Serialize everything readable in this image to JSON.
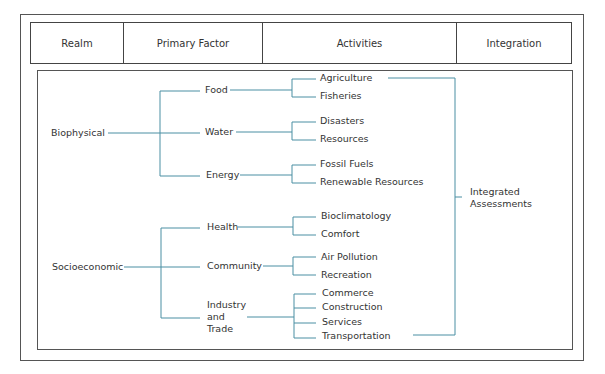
{
  "header": {
    "columns": [
      "Realm",
      "Primary Factor",
      "Activities",
      "Integration"
    ]
  },
  "tree": {
    "realms": [
      {
        "label": "Biophysical",
        "factors": [
          {
            "label": "Food",
            "activities": [
              "Agriculture",
              "Fisheries"
            ]
          },
          {
            "label": "Water",
            "activities": [
              "Disasters",
              "Resources"
            ]
          },
          {
            "label": "Energy",
            "activities": [
              "Fossil Fuels",
              "Renewable Resources"
            ]
          }
        ]
      },
      {
        "label": "Socioeconomic",
        "factors": [
          {
            "label": "Health",
            "activities": [
              "Bioclimatology",
              "Comfort"
            ]
          },
          {
            "label": "Community",
            "activities": [
              "Air Pollution",
              "Recreation"
            ]
          },
          {
            "label": "Industry and Trade",
            "label_lines": [
              "Industry",
              "and",
              "Trade"
            ],
            "activities": [
              "Commerce",
              "Construction",
              "Services",
              "Transportation"
            ]
          }
        ]
      }
    ],
    "integration": {
      "label_lines": [
        "Integrated",
        "Assessments"
      ]
    }
  },
  "colors": {
    "connector": "#4a8fa3",
    "border": "#555555",
    "text": "#333333"
  }
}
